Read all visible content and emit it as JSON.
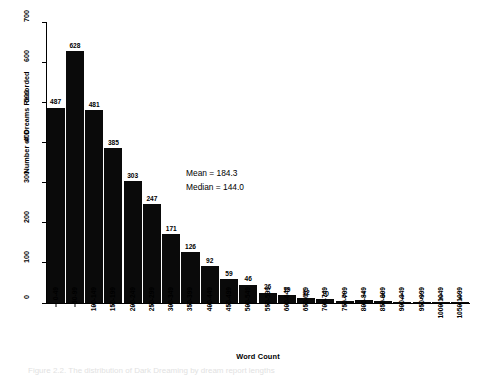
{
  "chart_data": {
    "type": "bar",
    "title": "",
    "xlabel": "Word Count",
    "ylabel": "Number of Dreams Recorded",
    "ylim": [
      0,
      700
    ],
    "yticks": [
      0,
      100,
      200,
      300,
      400,
      500,
      600,
      700
    ],
    "grid": false,
    "legend": null,
    "categories": [
      "0-49",
      "50-99",
      "100-149",
      "150-199",
      "200-249",
      "250-299",
      "300-349",
      "350-399",
      "400-449",
      "450-499",
      "500-549",
      "550-599",
      "600-649",
      "650-699",
      "700-749",
      "750-799",
      "800-849",
      "850-899",
      "900-949",
      "950-999",
      "1000-1049",
      "1050-1099"
    ],
    "values": [
      487,
      628,
      481,
      385,
      303,
      247,
      171,
      126,
      92,
      59,
      46,
      26,
      19,
      12,
      10,
      6,
      7,
      5,
      1,
      2,
      2,
      1
    ],
    "bar_color": "#0a0a0a",
    "annotations": [
      "Mean = 184.3",
      "Median = 144.0"
    ]
  },
  "annotation": {
    "mean": "Mean = 184.3",
    "median": "Median = 144.0"
  },
  "caption": {
    "text": "Figure 2.2.  The distribution of Dark Dreaming by dream report lengths"
  }
}
